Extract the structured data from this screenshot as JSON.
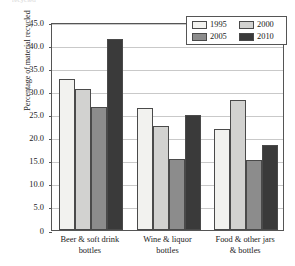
{
  "caption_remnant": "recycled",
  "chart_data": {
    "type": "bar",
    "title": "",
    "xlabel": "",
    "ylabel": "Percentage of material recycled",
    "ylim": [
      0,
      45
    ],
    "ytick_labels": [
      "45.0",
      "40.0",
      "35.0",
      "30.0",
      "25.0",
      "20.0",
      "15.0",
      "10.0",
      "5.0",
      "0"
    ],
    "ytick_values": [
      45,
      40,
      35,
      30,
      25,
      20,
      15,
      10,
      5,
      0
    ],
    "grid": true,
    "legend_position": "top-right",
    "categories": [
      "Beer & soft drink\nbottles",
      "Wine & liquor\nbottles",
      "Food & other jars\n& bottles"
    ],
    "series": [
      {
        "name": "1995",
        "color": "#f2f2ef",
        "values": [
          32.7,
          26.4,
          21.8
        ]
      },
      {
        "name": "2000",
        "color": "#d2d2d0",
        "values": [
          30.6,
          22.4,
          28.2
        ]
      },
      {
        "name": "2005",
        "color": "#8c8c8c",
        "values": [
          26.7,
          15.3,
          15.2
        ]
      },
      {
        "name": "2010",
        "color": "#3a3a3a",
        "values": [
          41.4,
          24.8,
          18.3
        ]
      }
    ]
  }
}
